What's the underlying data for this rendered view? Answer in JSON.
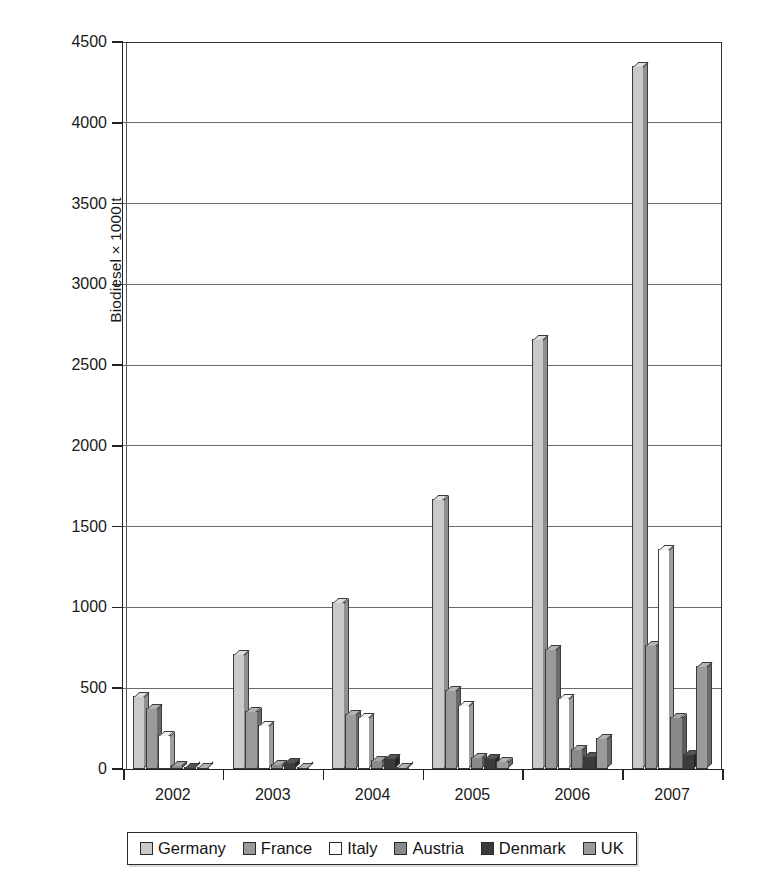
{
  "chart_data": {
    "type": "bar",
    "title": "",
    "subtitle": "",
    "xlabel": "",
    "ylabel": "Biodiesel × 1000 t",
    "categories": [
      "2002",
      "2003",
      "2004",
      "2005",
      "2006",
      "2007"
    ],
    "ylim": [
      0,
      4500
    ],
    "ytick_labels": [
      "0",
      "500",
      "1000",
      "1500",
      "2000",
      "2500",
      "3000",
      "3500",
      "4000",
      "4500"
    ],
    "ytick_values": [
      0,
      500,
      1000,
      1500,
      2000,
      2500,
      3000,
      3500,
      4000,
      4500
    ],
    "ytick_step": 500,
    "grid": "horizontal",
    "legend_position": "below-axis",
    "series": [
      {
        "name": "Germany",
        "color": "#c9c9c9",
        "values": [
          450,
          715,
          1035,
          1670,
          2660,
          4350
        ]
      },
      {
        "name": "France",
        "color": "#9a9a9a",
        "values": [
          375,
          357,
          340,
          490,
          740,
          770
        ]
      },
      {
        "name": "Italy",
        "color": "#ffffff",
        "values": [
          210,
          273,
          320,
          395,
          440,
          1360
        ]
      },
      {
        "name": "Austria",
        "color": "#8a8a8a",
        "values": [
          25,
          32,
          57,
          75,
          123,
          325
        ]
      },
      {
        "name": "Denmark",
        "color": "#3b3b3b",
        "values": [
          10,
          41,
          70,
          70,
          80,
          90
        ]
      },
      {
        "name": "UK",
        "color": "#9a9a9a",
        "values": [
          15,
          9,
          9,
          51,
          192,
          640
        ]
      }
    ]
  },
  "legend": {
    "items": [
      {
        "label": "Germany",
        "swatch": "legend-swatch-germany"
      },
      {
        "label": "France",
        "swatch": "legend-swatch-france"
      },
      {
        "label": "Italy",
        "swatch": "legend-swatch-italy"
      },
      {
        "label": "Austria",
        "swatch": "legend-swatch-austria"
      },
      {
        "label": "Denmark",
        "swatch": "legend-swatch-denmark"
      },
      {
        "label": "UK",
        "swatch": "legend-swatch-uk"
      }
    ]
  }
}
